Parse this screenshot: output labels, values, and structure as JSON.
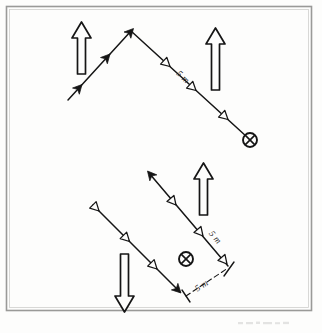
{
  "figure": {
    "background_color": "#fdfdfc",
    "ink_color": "#151515",
    "frame_color": "#9a9a98",
    "frame": {
      "x": 6,
      "y": 6,
      "width": 306,
      "height": 305
    }
  },
  "labels": {
    "upper_segment_length": "5 m",
    "lower_diagonal_length": "5 m",
    "lower_baseline_length": "5 m"
  },
  "symbols": {
    "into_page": "crossed-circle",
    "solid_head": "filled-triangle",
    "open_head": "outline-triangle"
  },
  "upper_diagram": {
    "incoming_ray": {
      "start_x": 68,
      "start_y": 100,
      "end_x": 131,
      "end_y": 31,
      "head_style": "filled-triangle",
      "head_count": 3
    },
    "outgoing_ray": {
      "start_x": 131,
      "start_y": 31,
      "end_x": 248,
      "end_y": 138,
      "head_style": "outline-triangle",
      "head_count": 3,
      "terminus": "crossed-circle"
    },
    "block_arrow_left": {
      "x": 77,
      "y": 22,
      "height": 52,
      "direction": "up"
    },
    "block_arrow_right": {
      "x": 213,
      "y": 28,
      "height": 62,
      "direction": "up"
    }
  },
  "lower_diagram": {
    "upper_diagonal": {
      "start_x": 148,
      "start_y": 172,
      "end_x": 228,
      "end_y": 266,
      "head_style": "outline-triangle",
      "head_count": 3,
      "origin_head": "filled-triangle"
    },
    "lower_diagonal": {
      "start_x": 93,
      "start_y": 205,
      "end_x": 181,
      "end_y": 292,
      "head_style": "outline-triangle",
      "head_count": 3,
      "terminus_head": "filled-triangle"
    },
    "into_page_marker_x": 186,
    "into_page_marker_y": 260,
    "block_arrow_up": {
      "x": 201,
      "y": 163,
      "height": 52,
      "direction": "up"
    },
    "block_arrow_down": {
      "x": 125,
      "y": 254,
      "height": 58,
      "direction": "down"
    }
  }
}
